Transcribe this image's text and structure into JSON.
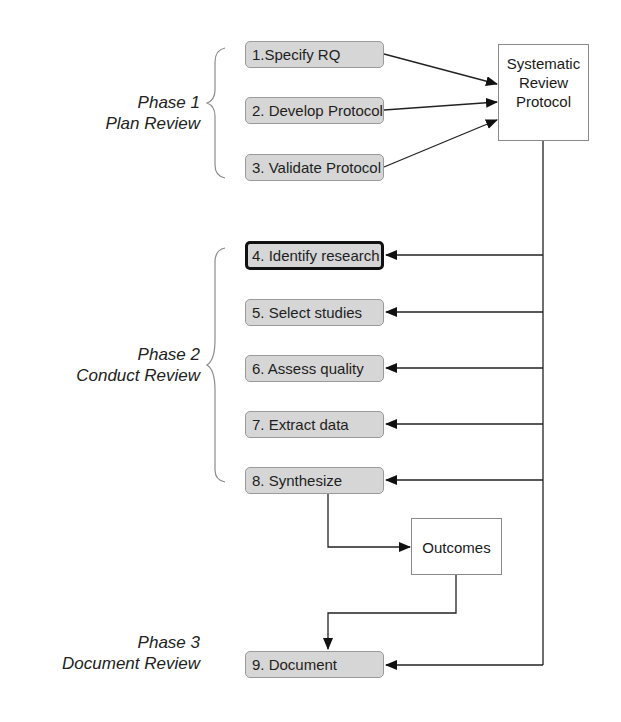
{
  "diagram": {
    "type": "flowchart",
    "phases": [
      {
        "id": "phase1",
        "title": "Phase 1",
        "subtitle": "Plan Review"
      },
      {
        "id": "phase2",
        "title": "Phase 2",
        "subtitle": "Conduct Review"
      },
      {
        "id": "phase3",
        "title": "Phase 3",
        "subtitle": "Document Review"
      }
    ],
    "steps": [
      {
        "label": "1.Specify RQ",
        "phase": "phase1"
      },
      {
        "label": "2. Develop Protocol",
        "phase": "phase1"
      },
      {
        "label": "3. Validate Protocol",
        "phase": "phase1"
      },
      {
        "label": "4. Identify research",
        "phase": "phase2",
        "highlighted": true
      },
      {
        "label": "5. Select studies",
        "phase": "phase2"
      },
      {
        "label": "6. Assess quality",
        "phase": "phase2"
      },
      {
        "label": "7. Extract data",
        "phase": "phase2"
      },
      {
        "label": "8. Synthesize",
        "phase": "phase2"
      },
      {
        "label": "9. Document",
        "phase": "phase3"
      }
    ],
    "documents": [
      {
        "id": "protocol",
        "lines": [
          "Systematic",
          "Review",
          "Protocol"
        ]
      },
      {
        "id": "outcomes",
        "lines": [
          "Outcomes"
        ]
      }
    ],
    "edges": [
      {
        "from": "1.Specify RQ",
        "to": "protocol"
      },
      {
        "from": "2. Develop Protocol",
        "to": "protocol"
      },
      {
        "from": "3. Validate Protocol",
        "to": "protocol"
      },
      {
        "from": "protocol",
        "to": "4. Identify research"
      },
      {
        "from": "protocol",
        "to": "5. Select studies"
      },
      {
        "from": "protocol",
        "to": "6. Assess quality"
      },
      {
        "from": "protocol",
        "to": "7. Extract data"
      },
      {
        "from": "protocol",
        "to": "8. Synthesize"
      },
      {
        "from": "protocol",
        "to": "9. Document"
      },
      {
        "from": "8. Synthesize",
        "to": "outcomes"
      },
      {
        "from": "outcomes",
        "to": "9. Document"
      }
    ],
    "colors": {
      "step_fill": "#d6d6d6",
      "step_border": "#9a9a9a",
      "highlight_border": "#111111",
      "line": "#222222",
      "brace": "#8c8c8c"
    }
  }
}
